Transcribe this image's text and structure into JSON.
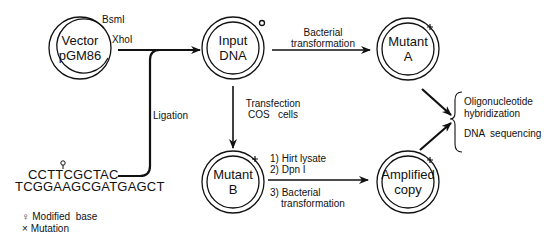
{
  "nodes": {
    "vector": {
      "line1": "Vector",
      "line2": "pGM86",
      "site1": "BsmI",
      "site2": "XhoI"
    },
    "input": {
      "line1": "Input",
      "line2": "DNA"
    },
    "mutantA": {
      "line1": "Mutant",
      "line2": "A"
    },
    "mutantB": {
      "line1": "Mutant",
      "line2": "B"
    },
    "amplified": {
      "line1": "Amplified",
      "line2": "copy"
    }
  },
  "edges": {
    "ligation": "Ligation",
    "bacterial_transformation": {
      "line1": "Bacterial",
      "line2": "transformation"
    },
    "transfection": {
      "line1": "Transfection",
      "line2": "COS   cells"
    },
    "steps": {
      "s1": "1) Hirt lysate",
      "s2": "2) Dpn I",
      "s3": "3) Bacterial",
      "s3b": "transformation"
    }
  },
  "oligo": {
    "top": "CCTTCGCTAC",
    "bottom": "TCGGAAGCGATGAGCT"
  },
  "analysis": {
    "line1": "Oligonucleotide",
    "line2": "hybridization",
    "line3": "DNA  sequencing"
  },
  "legend": {
    "modified": "Modified  base",
    "mutation": "Mutation",
    "modified_symbol": "♀",
    "mutation_symbol": "×"
  }
}
